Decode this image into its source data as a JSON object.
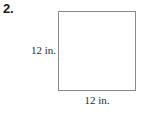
{
  "problem": {
    "number": "2."
  },
  "figure": {
    "shape_name": "square",
    "height_label": "12 in.",
    "width_label": "12 in.",
    "stroke_color": "#8a8a8a",
    "fill_color": "#ffffff"
  }
}
